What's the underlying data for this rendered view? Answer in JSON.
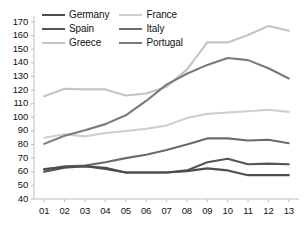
{
  "chart_data": {
    "type": "line",
    "title": "",
    "xlabel": "",
    "ylabel": "",
    "x": [
      "01",
      "02",
      "03",
      "04",
      "05",
      "06",
      "07",
      "08",
      "09",
      "10",
      "11",
      "12",
      "13"
    ],
    "ylim": [
      40,
      170
    ],
    "yticks": [
      40,
      50,
      60,
      70,
      80,
      90,
      100,
      110,
      120,
      130,
      140,
      150,
      160,
      170
    ],
    "grid": false,
    "legend_position": "top-left-inside",
    "series": [
      {
        "name": "Germany",
        "color": "#4d4d4d",
        "values": [
          62,
          63.5,
          64,
          63,
          59.5,
          59.5,
          59.5,
          60.5,
          62.5,
          61,
          57.5,
          57.5,
          57.5
        ]
      },
      {
        "name": "France",
        "color": "#cfcfcf",
        "values": [
          85,
          87.5,
          86,
          88.5,
          90,
          91.5,
          94,
          99.5,
          102.5,
          103.5,
          104.5,
          105.5,
          104
        ]
      },
      {
        "name": "Spain",
        "color": "#555555",
        "values": [
          60,
          63,
          64,
          62,
          59.5,
          59.5,
          59.5,
          61,
          67,
          69.5,
          65.5,
          66,
          65.5
        ]
      },
      {
        "name": "Italy",
        "color": "#6b6b6b",
        "values": [
          61.5,
          64,
          64.5,
          67,
          70,
          72.5,
          76,
          80,
          84.5,
          84.5,
          83,
          83.5,
          81
        ]
      },
      {
        "name": "Greece",
        "color": "#c4c4c4",
        "values": [
          115.5,
          121,
          120.5,
          120.5,
          116,
          117.5,
          122.5,
          135,
          155,
          155,
          160.5,
          167,
          163.5
        ]
      },
      {
        "name": "Portugal",
        "color": "#7a7a7a",
        "values": [
          80.5,
          86.5,
          90.5,
          95,
          101.5,
          112,
          124,
          132,
          138.5,
          143.5,
          142,
          136,
          128.5
        ]
      }
    ]
  },
  "legend": {
    "entries": [
      {
        "label": "Germany"
      },
      {
        "label": "France"
      },
      {
        "label": "Spain"
      },
      {
        "label": "Italy"
      },
      {
        "label": "Greece"
      },
      {
        "label": "Portugal"
      }
    ]
  },
  "axes": {
    "axis_color": "#bdbdbd"
  }
}
